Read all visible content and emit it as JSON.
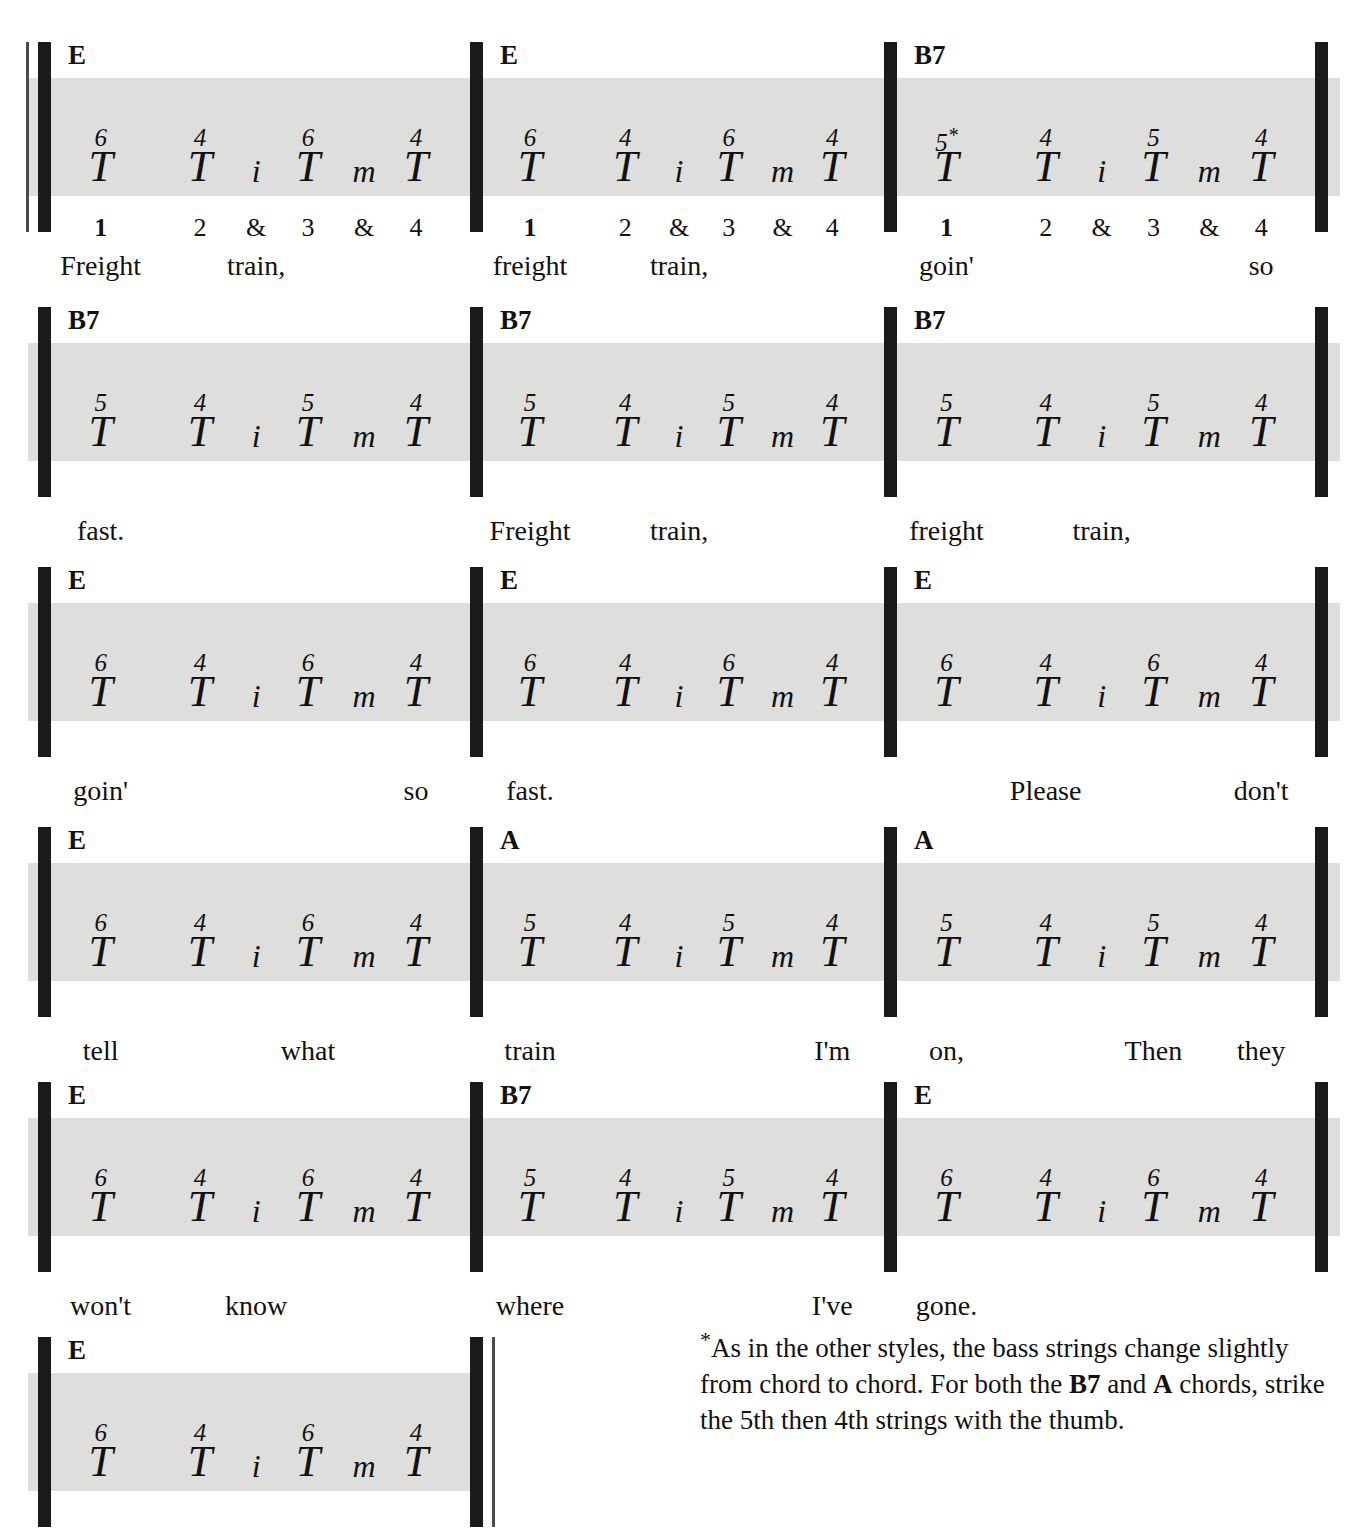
{
  "colors": {
    "band": "#dededd",
    "barline": "#1a1a1a",
    "text": "#111111"
  },
  "pattern_tokens": [
    "T",
    "T",
    "i",
    "T",
    "m",
    "T"
  ],
  "beat_row": {
    "labels": [
      "1",
      "2",
      "&",
      "3",
      "&",
      "4"
    ],
    "strong": [
      true,
      false,
      false,
      false,
      false,
      false
    ]
  },
  "footnote": {
    "marker": "*",
    "text_1": "As in the other styles, the bass strings change slightly from chord to chord. For both the ",
    "bold_1": "B7",
    "text_2": " and ",
    "bold_2": "A",
    "text_3": " chords, strike the 5th then 4th strings with the thumb."
  },
  "systems": [
    {
      "name": "system-1",
      "show_beats": true,
      "measures": [
        {
          "name": "measure-1",
          "chord": "E",
          "strings": [
            "6",
            "",
            "",
            "6",
            "",
            ""
          ],
          "string_labels": [
            "6",
            "4",
            "",
            "6",
            "",
            "4"
          ],
          "letters": [
            "T",
            "T",
            "i",
            "T",
            "m",
            "T"
          ],
          "star_on": -1,
          "lyrics": [
            {
              "text": "Freight",
              "beat": 0
            },
            {
              "text": "train,",
              "beat": 2
            }
          ]
        },
        {
          "name": "measure-2",
          "chord": "E",
          "string_labels": [
            "6",
            "4",
            "",
            "6",
            "",
            "4"
          ],
          "letters": [
            "T",
            "T",
            "i",
            "T",
            "m",
            "T"
          ],
          "star_on": -1,
          "lyrics": [
            {
              "text": "freight",
              "beat": 0
            },
            {
              "text": "train,",
              "beat": 2
            }
          ]
        },
        {
          "name": "measure-3",
          "chord": "B7",
          "string_labels": [
            "5",
            "4",
            "",
            "5",
            "",
            "4"
          ],
          "letters": [
            "T",
            "T",
            "i",
            "T",
            "m",
            "T"
          ],
          "star_on": 0,
          "lyrics": [
            {
              "text": "goin'",
              "beat": 0
            },
            {
              "text": "so",
              "beat": 5
            }
          ]
        }
      ]
    },
    {
      "name": "system-2",
      "show_beats": false,
      "measures": [
        {
          "name": "measure-4",
          "chord": "B7",
          "string_labels": [
            "5",
            "4",
            "",
            "5",
            "",
            "4"
          ],
          "letters": [
            "T",
            "T",
            "i",
            "T",
            "m",
            "T"
          ],
          "star_on": -1,
          "lyrics": [
            {
              "text": "fast.",
              "beat": 0
            }
          ]
        },
        {
          "name": "measure-5",
          "chord": "B7",
          "string_labels": [
            "5",
            "4",
            "",
            "5",
            "",
            "4"
          ],
          "letters": [
            "T",
            "T",
            "i",
            "T",
            "m",
            "T"
          ],
          "star_on": -1,
          "lyrics": [
            {
              "text": "Freight",
              "beat": 0
            },
            {
              "text": "train,",
              "beat": 2
            }
          ]
        },
        {
          "name": "measure-6",
          "chord": "B7",
          "string_labels": [
            "5",
            "4",
            "",
            "5",
            "",
            "4"
          ],
          "letters": [
            "T",
            "T",
            "i",
            "T",
            "m",
            "T"
          ],
          "star_on": -1,
          "lyrics": [
            {
              "text": "freight",
              "beat": 0
            },
            {
              "text": "train,",
              "beat": 2
            }
          ]
        }
      ]
    },
    {
      "name": "system-3",
      "show_beats": false,
      "measures": [
        {
          "name": "measure-7",
          "chord": "E",
          "string_labels": [
            "6",
            "4",
            "",
            "6",
            "",
            "4"
          ],
          "letters": [
            "T",
            "T",
            "i",
            "T",
            "m",
            "T"
          ],
          "star_on": -1,
          "lyrics": [
            {
              "text": "goin'",
              "beat": 0
            },
            {
              "text": "so",
              "beat": 5
            }
          ]
        },
        {
          "name": "measure-8",
          "chord": "E",
          "string_labels": [
            "6",
            "4",
            "",
            "6",
            "",
            "4"
          ],
          "letters": [
            "T",
            "T",
            "i",
            "T",
            "m",
            "T"
          ],
          "star_on": -1,
          "lyrics": [
            {
              "text": "fast.",
              "beat": 0
            }
          ]
        },
        {
          "name": "measure-9",
          "chord": "E",
          "string_labels": [
            "6",
            "4",
            "",
            "6",
            "",
            "4"
          ],
          "letters": [
            "T",
            "T",
            "i",
            "T",
            "m",
            "T"
          ],
          "star_on": -1,
          "lyrics": [
            {
              "text": "Please",
              "beat": 1
            },
            {
              "text": "don't",
              "beat": 5
            }
          ]
        }
      ]
    },
    {
      "name": "system-4",
      "show_beats": false,
      "measures": [
        {
          "name": "measure-10",
          "chord": "E",
          "string_labels": [
            "6",
            "4",
            "",
            "6",
            "",
            "4"
          ],
          "letters": [
            "T",
            "T",
            "i",
            "T",
            "m",
            "T"
          ],
          "star_on": -1,
          "lyrics": [
            {
              "text": "tell",
              "beat": 0
            },
            {
              "text": "what",
              "beat": 3
            }
          ]
        },
        {
          "name": "measure-11",
          "chord": "A",
          "string_labels": [
            "5",
            "4",
            "",
            "5",
            "",
            "4"
          ],
          "letters": [
            "T",
            "T",
            "i",
            "T",
            "m",
            "T"
          ],
          "star_on": -1,
          "lyrics": [
            {
              "text": "train",
              "beat": 0
            },
            {
              "text": "I'm",
              "beat": 5
            }
          ]
        },
        {
          "name": "measure-12",
          "chord": "A",
          "string_labels": [
            "5",
            "4",
            "",
            "5",
            "",
            "4"
          ],
          "letters": [
            "T",
            "T",
            "i",
            "T",
            "m",
            "T"
          ],
          "star_on": -1,
          "lyrics": [
            {
              "text": "on,",
              "beat": 0
            },
            {
              "text": "Then",
              "beat": 3
            },
            {
              "text": "they",
              "beat": 5
            }
          ]
        }
      ]
    },
    {
      "name": "system-5",
      "show_beats": false,
      "measures": [
        {
          "name": "measure-13",
          "chord": "E",
          "string_labels": [
            "6",
            "4",
            "",
            "6",
            "",
            "4"
          ],
          "letters": [
            "T",
            "T",
            "i",
            "T",
            "m",
            "T"
          ],
          "star_on": -1,
          "lyrics": [
            {
              "text": "won't",
              "beat": 0
            },
            {
              "text": "know",
              "beat": 2
            }
          ]
        },
        {
          "name": "measure-14",
          "chord": "B7",
          "string_labels": [
            "5",
            "4",
            "",
            "5",
            "",
            "4"
          ],
          "letters": [
            "T",
            "T",
            "i",
            "T",
            "m",
            "T"
          ],
          "star_on": -1,
          "lyrics": [
            {
              "text": "where",
              "beat": 0
            },
            {
              "text": "I've",
              "beat": 5
            }
          ]
        },
        {
          "name": "measure-15",
          "chord": "E",
          "string_labels": [
            "6",
            "4",
            "",
            "6",
            "",
            "4"
          ],
          "letters": [
            "T",
            "T",
            "i",
            "T",
            "m",
            "T"
          ],
          "star_on": -1,
          "lyrics": [
            {
              "text": "gone.",
              "beat": 0
            }
          ]
        }
      ]
    },
    {
      "name": "system-6",
      "show_beats": false,
      "measures": [
        {
          "name": "measure-16",
          "chord": "E",
          "string_labels": [
            "6",
            "4",
            "",
            "6",
            "",
            "4"
          ],
          "letters": [
            "T",
            "T",
            "i",
            "T",
            "m",
            "T"
          ],
          "star_on": -1,
          "lyrics": []
        }
      ]
    }
  ]
}
